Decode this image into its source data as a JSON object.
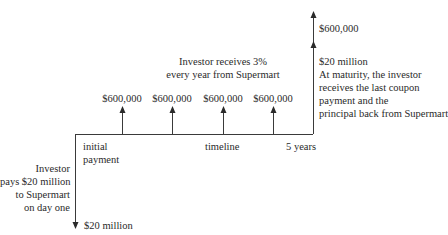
{
  "diagram": {
    "coupon_note": [
      "Investor receives 3%",
      "every year from Supermart"
    ],
    "coupon_labels": [
      "$600,000",
      "$600,000",
      "$600,000",
      "$600,000"
    ],
    "final_coupon_label": "$600,000",
    "principal_label": "$20 million",
    "maturity_note": [
      "At maturity, the investor",
      "receives the last coupon",
      "payment and the",
      "principal back from Supermart"
    ],
    "initial_payment_label": [
      "initial",
      "payment"
    ],
    "timeline_label": "timeline",
    "end_label": "5 years",
    "investor_note": [
      "Investor",
      "pays $20 million",
      "to Supermart",
      "on day one"
    ],
    "outflow_label": "$20 million",
    "colors": {
      "line": "#3a3a3a",
      "text": "#2a2a2a"
    }
  }
}
